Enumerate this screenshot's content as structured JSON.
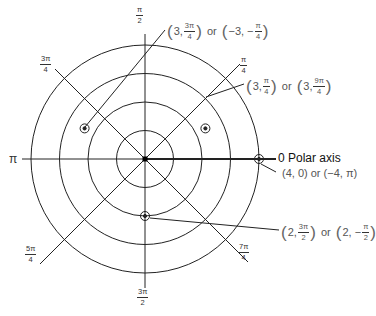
{
  "diagram": {
    "center": {
      "x": 145,
      "y": 159
    },
    "unit_px": 28.5,
    "rings": [
      1,
      2,
      3,
      4
    ],
    "axis_label": "0 Polar axis",
    "angle_labels": [
      {
        "id": "pi-over-2",
        "num": "π",
        "den": "2"
      },
      {
        "id": "pi-over-4",
        "num": "π",
        "den": "4"
      },
      {
        "id": "3pi-over-4",
        "num": "3π",
        "den": "4"
      },
      {
        "id": "pi",
        "text": "π"
      },
      {
        "id": "5pi-over-4",
        "num": "5π",
        "den": "4"
      },
      {
        "id": "3pi-over-2",
        "num": "3π",
        "den": "2"
      },
      {
        "id": "7pi-over-4",
        "num": "7π",
        "den": "4"
      }
    ],
    "points": [
      {
        "r": 3,
        "theta": "3π/4",
        "label_a": "3,",
        "a_num": "3π",
        "a_den": "4",
        "or": "or",
        "label_b": "−3, −",
        "b_num": "π",
        "b_den": "4"
      },
      {
        "r": 3,
        "theta": "π/4",
        "label_a": "3,",
        "a_num": "π",
        "a_den": "4",
        "or": "or",
        "label_b": "3,",
        "b_num": "9π",
        "b_den": "4"
      },
      {
        "r": 4,
        "theta": "0",
        "text": "(4, 0) or (−4, π)"
      },
      {
        "r": 2,
        "theta": "3π/2",
        "label_a": "2,",
        "a_num": "3π",
        "a_den": "2",
        "or": "or",
        "label_b": "2, −",
        "b_num": "π",
        "b_den": "2"
      }
    ]
  }
}
